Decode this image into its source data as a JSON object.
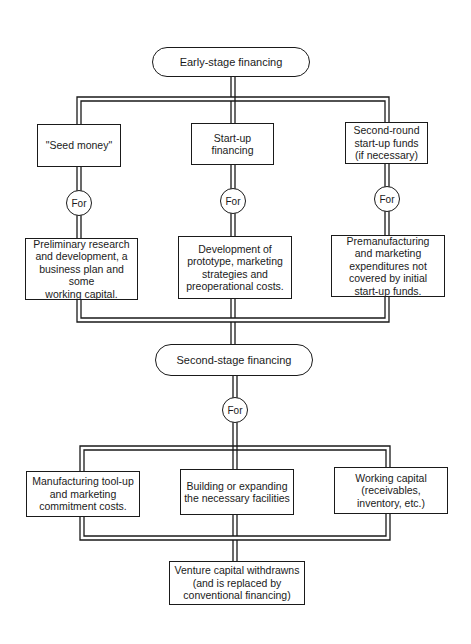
{
  "diagram": {
    "type": "flowchart",
    "stroke_color": "#1a1a1a",
    "background": "#ffffff",
    "stages": {
      "early": {
        "label": "Early-stage financing"
      },
      "second": {
        "label": "Second-stage financing"
      }
    },
    "early_branches": [
      {
        "source": "\"Seed money\"",
        "connector": "For",
        "purpose": "Preliminary research\nand development, a\nbusiness plan and some\nworking capital."
      },
      {
        "source": "Start-up\nfinancing",
        "connector": "For",
        "purpose": "Development of\nprototype, marketing\nstrategies and\npreoperational costs."
      },
      {
        "source": "Second-round\nstart-up funds\n(if necessary)",
        "connector": "For",
        "purpose": "Premanufacturing\nand marketing\nexpenditures not\ncovered by initial\nstart-up funds."
      }
    ],
    "second_connector": "For",
    "second_uses": [
      {
        "label": "Manufacturing tool-up\nand marketing\ncommitment costs."
      },
      {
        "label": "Building or expanding\nthe necessary facilities"
      },
      {
        "label": "Working capital\n(receivables,\ninventory, etc.)"
      }
    ],
    "outcome": {
      "label": "Venture capital withdrawns\n(and is replaced by\nconventional financing)"
    }
  }
}
